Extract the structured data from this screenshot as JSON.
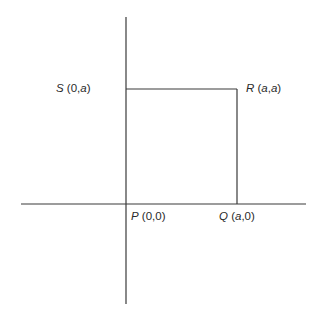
{
  "diagram": {
    "type": "coordinate-square",
    "stroke_color": "#3a3a3a",
    "axes": {
      "x_axis": {
        "y": 204,
        "x1": 21,
        "x2": 306
      },
      "y_axis": {
        "x": 126,
        "y1": 17,
        "y2": 304
      }
    },
    "square": {
      "x1": 126,
      "y1": 89,
      "x2": 237,
      "y2": 204
    },
    "points": [
      {
        "name": "P",
        "coords": "(0,0)",
        "letter": "P",
        "open": " (",
        "c1": "0",
        "sep": ",",
        "c2": "0",
        "close": ")"
      },
      {
        "name": "Q",
        "coords": "(a,0)",
        "letter": "Q",
        "open": " (",
        "c1": "a",
        "sep": ",",
        "c2": "0",
        "close": ")"
      },
      {
        "name": "R",
        "coords": "(a,a)",
        "letter": "R",
        "open": " (",
        "c1": "a",
        "sep": ",",
        "c2": "a",
        "close": ")"
      },
      {
        "name": "S",
        "coords": "(0,a)",
        "letter": "S",
        "open": " (",
        "c1": "0",
        "sep": ",",
        "c2": "a",
        "close": ")"
      }
    ]
  }
}
